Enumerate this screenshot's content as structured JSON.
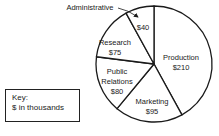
{
  "chart_data": {
    "type": "pie",
    "title": "",
    "unit_note": "$ in thousands",
    "categories": [
      "Production",
      "Marketing",
      "Public Relations",
      "Research",
      "Administrative"
    ],
    "values": [
      210,
      95,
      80,
      75,
      40
    ],
    "value_labels": [
      "$210",
      "$95",
      "$80",
      "$75",
      "$40"
    ],
    "start_angle_deg": 0,
    "direction": "clockwise",
    "colors": [
      "#ffffff",
      "#ffffff",
      "#ffffff",
      "#ffffff",
      "#ffffff"
    ],
    "stroke": "#1a1a1a",
    "legend": {
      "title": "Key:",
      "text": "$ in thousands",
      "position": "lower-left"
    },
    "annotations": [
      {
        "text": "Administrative",
        "target": "Administrative",
        "arrow": true
      }
    ]
  },
  "labels": {
    "production": {
      "name": "Production",
      "value": "$210"
    },
    "marketing": {
      "name": "Marketing",
      "value": "$95"
    },
    "public_relations": {
      "name1": "Public",
      "name2": "Relations",
      "value": "$80"
    },
    "research": {
      "name": "Research",
      "value": "$75"
    },
    "administrative": {
      "name": "Administrative",
      "value": "$40"
    }
  },
  "key": {
    "title": "Key:",
    "text": "$ in thousands"
  }
}
